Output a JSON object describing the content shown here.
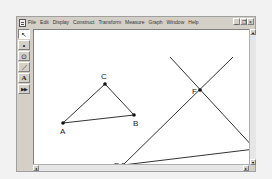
{
  "app": {
    "name": "Geometer's Sketchpad"
  },
  "menubar": {
    "items": [
      "File",
      "Edit",
      "Display",
      "Construct",
      "Transform",
      "Measure",
      "Graph",
      "Window",
      "Help"
    ]
  },
  "window_controls": {
    "minimize": "_",
    "restore": "❐",
    "close": "×"
  },
  "toolbox": {
    "tools": [
      {
        "name": "selection-arrow",
        "glyph": "↖",
        "active": true
      },
      {
        "name": "point",
        "glyph": "•",
        "active": false
      },
      {
        "name": "compass",
        "glyph": "⊙",
        "active": false
      },
      {
        "name": "straightedge",
        "glyph": "⟋",
        "active": false
      },
      {
        "name": "text",
        "glyph": "A",
        "active": false
      },
      {
        "name": "custom",
        "glyph": "▶▶",
        "active": false
      }
    ]
  },
  "scrollbars": {
    "up": "▴",
    "down": "▾",
    "left": "◂",
    "right": "▸"
  },
  "sketch": {
    "points": [
      {
        "label": "A",
        "x": 29,
        "y": 93,
        "lx": 26,
        "ly": 104
      },
      {
        "label": "B",
        "x": 100,
        "y": 85,
        "lx": 99,
        "ly": 96
      },
      {
        "label": "C",
        "x": 71,
        "y": 54,
        "lx": 67,
        "ly": 49
      },
      {
        "label": "D",
        "x": 89,
        "y": 135,
        "lx": 80,
        "ly": 138
      },
      {
        "label": "E",
        "x": 221,
        "y": 119,
        "lx": 223,
        "ly": 122
      },
      {
        "label": "F",
        "x": 166,
        "y": 60,
        "lx": 158,
        "ly": 64
      }
    ],
    "segments": [
      [
        "A",
        "B"
      ],
      [
        "B",
        "C"
      ],
      [
        "C",
        "A"
      ],
      [
        "D",
        "E"
      ]
    ],
    "lines": [
      {
        "x1": 136,
        "y1": 27,
        "x2": 221,
        "y2": 119
      },
      {
        "x1": 199,
        "y1": 27,
        "x2": 89,
        "y2": 135
      }
    ],
    "stroke_color": "#333333"
  }
}
